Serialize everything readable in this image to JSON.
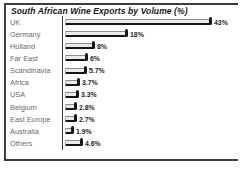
{
  "chart": {
    "title": "South African Wine Exports by Volume (%)"
  },
  "chart_data": {
    "type": "bar",
    "orientation": "horizontal",
    "title": "South African Wine Exports by Volume (%)",
    "categories": [
      "UK",
      "Germany",
      "Holland",
      "Far East",
      "Scandinavia",
      "Africa",
      "USA",
      "Belgium",
      "East Europe",
      "Australia",
      "Others"
    ],
    "values": [
      43,
      18,
      8,
      6,
      5.7,
      3.7,
      3.3,
      2.8,
      2.7,
      1.9,
      4.6
    ],
    "value_labels": [
      "43%",
      "18%",
      "8%",
      "6%",
      "5.7%",
      "3.7%",
      "3.3%",
      "2.8%",
      "2.7%",
      "1.9%",
      "4.6%"
    ],
    "unit": "%",
    "xlim": [
      0,
      45
    ],
    "grid": false,
    "legend": false,
    "colors": {
      "bar_fill": "#ececec",
      "bar_edge": "#161616",
      "category_text": "#6b6b6b",
      "value_text": "#1f1f1f",
      "frame": "#3d3d3d"
    }
  }
}
